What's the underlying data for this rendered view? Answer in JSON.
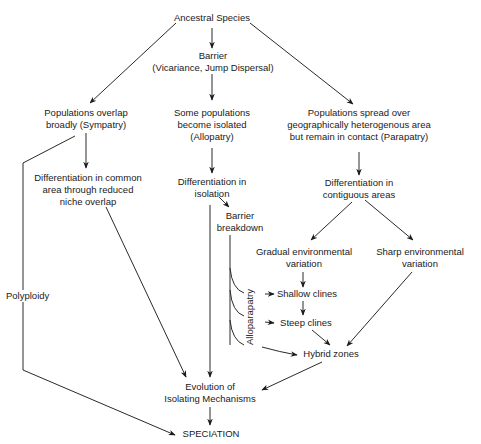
{
  "diagram": {
    "type": "flowchart",
    "nodes": {
      "ancestral": "Ancestral  Species",
      "barrier": [
        "Barrier",
        "(Vicariance, Jump Dispersal)"
      ],
      "sympatry": [
        "Populations overlap",
        "broadly (Sympatry)"
      ],
      "allopatry": [
        "Some populations",
        "become isolated",
        "(Allopatry)"
      ],
      "parapatry": [
        "Populations spread over",
        "geographically heterogenous area",
        "but remain in contact (Parapatry)"
      ],
      "diff_common": [
        "Differentiation in common",
        "area through reduced",
        "niche overlap"
      ],
      "diff_isolation": [
        "Differentiation in",
        "isolation"
      ],
      "diff_contiguous": [
        "Differentiation in",
        "contiguous areas"
      ],
      "barrier_breakdown": [
        "Barrier",
        "breakdown"
      ],
      "gradual": [
        "Gradual environmental",
        "variation"
      ],
      "sharp": [
        "Sharp environmental",
        "variation"
      ],
      "shallow": "Shallow clines",
      "steep": "Steep clines",
      "hybrid": "Hybrid zones",
      "isolating": [
        "Evolution of",
        "Isolating Mechanisms"
      ],
      "speciation": "SPECIATION"
    },
    "edge_labels": {
      "polyploidy": "Polyploidy",
      "alloparapatry": "Alloparapatry"
    },
    "edges": [
      {
        "from": "Ancestral Species",
        "to": "Barrier"
      },
      {
        "from": "Ancestral Species",
        "to": "Populations overlap broadly (Sympatry)"
      },
      {
        "from": "Ancestral Species",
        "to": "Populations spread over ... (Parapatry)"
      },
      {
        "from": "Barrier",
        "to": "Some populations become isolated (Allopatry)"
      },
      {
        "from": "Sympatry",
        "to": "Differentiation in common area through reduced niche overlap"
      },
      {
        "from": "Sympatry",
        "to": "SPECIATION",
        "label": "Polyploidy"
      },
      {
        "from": "Allopatry",
        "to": "Differentiation in isolation"
      },
      {
        "from": "Parapatry",
        "to": "Differentiation in contiguous areas"
      },
      {
        "from": "Differentiation in common area",
        "to": "Evolution of Isolating Mechanisms"
      },
      {
        "from": "Differentiation in isolation",
        "to": "Evolution of Isolating Mechanisms"
      },
      {
        "from": "Differentiation in isolation",
        "to": "Barrier breakdown"
      },
      {
        "from": "Barrier breakdown",
        "to": "Shallow clines",
        "label": "Alloparapatry"
      },
      {
        "from": "Barrier breakdown",
        "to": "Steep clines",
        "label": "Alloparapatry"
      },
      {
        "from": "Barrier breakdown",
        "to": "Hybrid zones",
        "label": "Alloparapatry"
      },
      {
        "from": "Differentiation in contiguous areas",
        "to": "Gradual environmental variation"
      },
      {
        "from": "Differentiation in contiguous areas",
        "to": "Sharp environmental variation"
      },
      {
        "from": "Gradual environmental variation",
        "to": "Shallow clines"
      },
      {
        "from": "Shallow clines",
        "to": "Steep clines"
      },
      {
        "from": "Steep clines",
        "to": "Hybrid zones"
      },
      {
        "from": "Sharp environmental variation",
        "to": "Hybrid zones"
      },
      {
        "from": "Hybrid zones",
        "to": "Evolution of Isolating Mechanisms"
      },
      {
        "from": "Evolution of Isolating Mechanisms",
        "to": "SPECIATION"
      }
    ]
  }
}
